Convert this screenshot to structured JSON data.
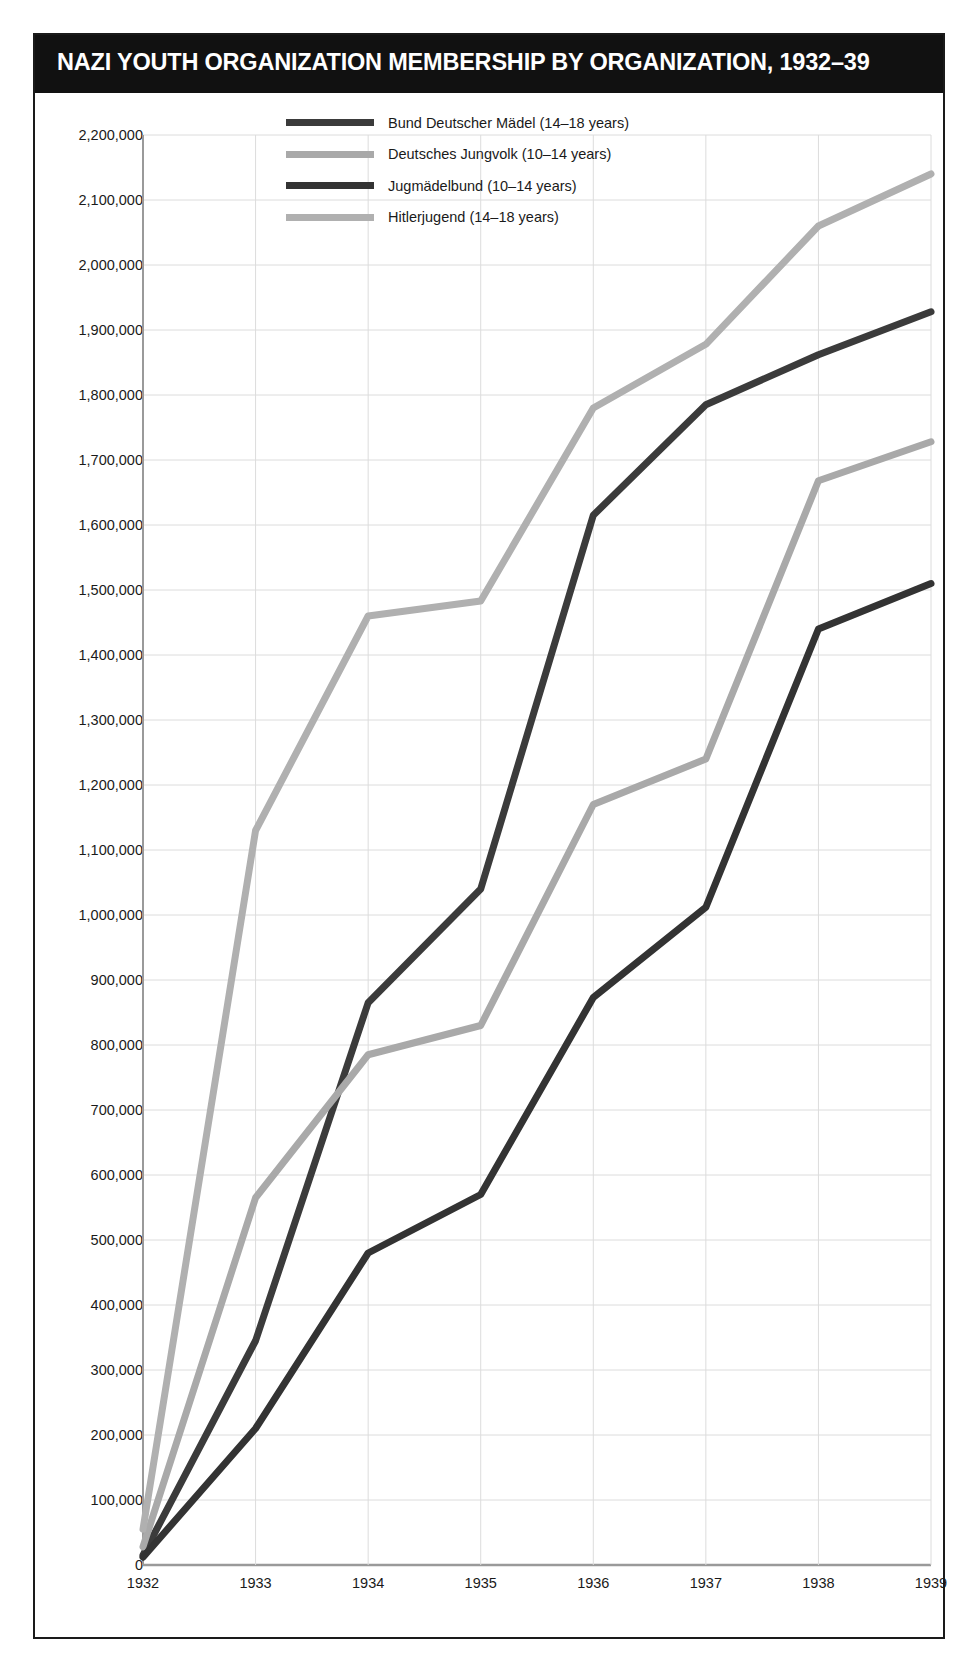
{
  "header": {
    "title": "NAZI YOUTH ORGANIZATION MEMBERSHIP BY ORGANIZATION, 1932–39"
  },
  "chart_data": {
    "type": "line",
    "title": "NAZI YOUTH ORGANIZATION MEMBERSHIP BY ORGANIZATION, 1932–39",
    "xlabel": "",
    "ylabel": "",
    "x": [
      "1932",
      "1933",
      "1934",
      "1935",
      "1936",
      "1937",
      "1938",
      "1939"
    ],
    "categories": [
      "1932",
      "1933",
      "1934",
      "1935",
      "1936",
      "1937",
      "1938",
      "1939"
    ],
    "ylim": [
      0,
      2200000
    ],
    "ytick_step": 100000,
    "ytick_labels": [
      "2,200,000",
      "2,100,000",
      "2,000,000",
      "1,900,000",
      "1,800,000",
      "1,700,000",
      "1,600,000",
      "1,500,000",
      "1,400,000",
      "1,300,000",
      "1,200,000",
      "1,100,000",
      "1,000,000",
      "900,000",
      "800,000",
      "700,000",
      "600,000",
      "500,000",
      "400,000",
      "300,000",
      "200,000",
      "100,000",
      "0"
    ],
    "ytick_values": [
      2200000,
      2100000,
      2000000,
      1900000,
      1800000,
      1700000,
      1600000,
      1500000,
      1400000,
      1300000,
      1200000,
      1100000,
      1000000,
      900000,
      800000,
      700000,
      600000,
      500000,
      400000,
      300000,
      200000,
      100000,
      0
    ],
    "grid": true,
    "grid_color": "#dcdcdc",
    "legend_position": "top-center",
    "series": [
      {
        "name": "Bund Deutscher Mädel (14–18 years)",
        "color": "#3b3b3b",
        "values": [
          15000,
          345000,
          865000,
          1040000,
          1615000,
          1785000,
          1862000,
          1928000
        ]
      },
      {
        "name": "Deutsches Jungvolk (10–14 years)",
        "color": "#a9a9a9",
        "values": [
          28000,
          565000,
          785000,
          830000,
          1170000,
          1240000,
          1668000,
          1728000
        ]
      },
      {
        "name": "Jugmädelbund (10–14 years)",
        "color": "#333333",
        "values": [
          12000,
          210000,
          480000,
          570000,
          873000,
          1012000,
          1440000,
          1510000
        ]
      },
      {
        "name": "Hitlerjugend (14–18 years)",
        "color": "#b0b0b0",
        "values": [
          55000,
          1130000,
          1460000,
          1483000,
          1780000,
          1878000,
          2060000,
          2140000
        ]
      }
    ]
  },
  "legend": {
    "items": [
      {
        "label": "Bund Deutscher Mädel (14–18 years)",
        "color": "#3b3b3b"
      },
      {
        "label": "Deutsches Jungvolk (10–14 years)",
        "color": "#a9a9a9"
      },
      {
        "label": "Jugmädelbund (10–14 years)",
        "color": "#333333"
      },
      {
        "label": "Hitlerjugend (14–18 years)",
        "color": "#b0b0b0"
      }
    ]
  }
}
